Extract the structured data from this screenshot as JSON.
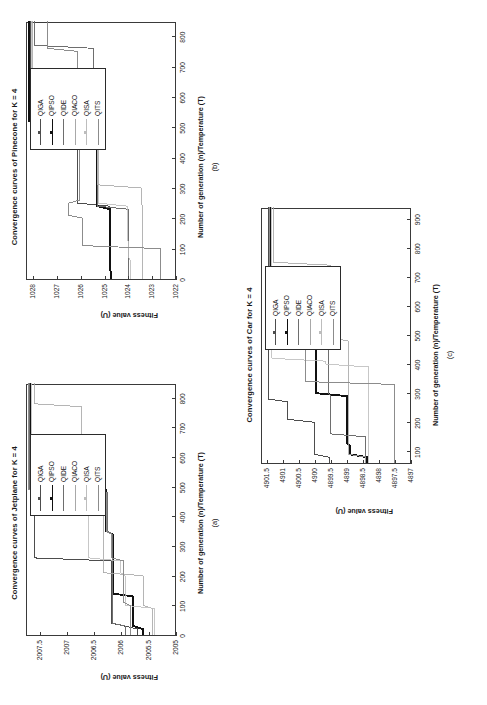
{
  "figure": {
    "orientation_deg": -90,
    "background": "#ffffff",
    "series_names": [
      "QIGA",
      "QIPSO",
      "QIDE",
      "QIACO",
      "QISA",
      "QITS"
    ],
    "series_colors": [
      "#4d4d4d",
      "#111111",
      "#6e6e6e",
      "#a8a8a8",
      "#bdbdbd",
      "#8c8c8c"
    ]
  },
  "panels": {
    "a": {
      "label": "(a)",
      "title": "Convergence curves of Jetplane for K = 4",
      "xlabel": "Number of generation (n)/Temperature (T)",
      "ylabel": "Fitness value (U)"
    },
    "b": {
      "label": "(b)",
      "title": "Convergence curves of Pinecone for K = 4",
      "xlabel": "Number of generation (n)/Temperature (T)",
      "ylabel": "Fitness value (U)"
    },
    "c": {
      "label": "(c)",
      "title": "Convergence curves of Car for K = 4",
      "xlabel": "Number of generation (n)/Temperature (T)",
      "ylabel": "Fitness value (U)"
    }
  },
  "chart_data": [
    {
      "id": "a",
      "type": "line",
      "title": "Convergence curves of Jetplane for K = 4",
      "xlabel": "Number of generation (n)/Temperature (T)",
      "ylabel": "Fitness value (U)",
      "xlim": [
        0,
        850
      ],
      "ylim": [
        2005,
        2007.75
      ],
      "xticks": [
        0,
        100,
        200,
        300,
        400,
        500,
        600,
        700,
        800
      ],
      "yticks": [
        2005,
        2005.5,
        2006,
        2006.5,
        2007,
        2007.5
      ],
      "grid": false,
      "legend_position": "upper right",
      "series": [
        {
          "name": "QIGA",
          "x": [
            0,
            20,
            40,
            250,
            260,
            480,
            490,
            850
          ],
          "y": [
            2005.72,
            2005.72,
            2006.2,
            2006.2,
            2007.62,
            2007.62,
            2007.68,
            2007.68
          ]
        },
        {
          "name": "QIPSO",
          "x": [
            0,
            20,
            30,
            130,
            140,
            340,
            350,
            490,
            500,
            850
          ],
          "y": [
            2005.62,
            2005.62,
            2005.8,
            2005.8,
            2006.18,
            2006.18,
            2006.3,
            2006.3,
            2007.7,
            2007.7
          ]
        },
        {
          "name": "QIDE",
          "x": [
            0,
            30,
            40,
            340,
            350,
            480,
            490,
            850
          ],
          "y": [
            2005.95,
            2005.95,
            2006.18,
            2006.18,
            2006.28,
            2006.28,
            2007.7,
            2007.7
          ]
        },
        {
          "name": "QIACO",
          "x": [
            0,
            90,
            100,
            200,
            210,
            420,
            430,
            560,
            570,
            770,
            780,
            850
          ],
          "y": [
            2005.45,
            2005.45,
            2005.62,
            2005.62,
            2006.35,
            2006.35,
            2006.45,
            2006.45,
            2006.75,
            2006.75,
            2007.62,
            2007.62
          ]
        },
        {
          "name": "QISA",
          "x": [
            0,
            90,
            100,
            200,
            210,
            250,
            260,
            430,
            440,
            470,
            480,
            850
          ],
          "y": [
            2005.42,
            2005.42,
            2005.95,
            2005.95,
            2006.03,
            2006.03,
            2006.62,
            2006.62,
            2006.5,
            2006.5,
            2007.66,
            2007.66
          ]
        },
        {
          "name": "QITS",
          "x": [
            0,
            100,
            110,
            250,
            260,
            340,
            350,
            480,
            490,
            850
          ],
          "y": [
            2005.86,
            2005.86,
            2005.98,
            2005.98,
            2006.2,
            2006.2,
            2006.3,
            2006.3,
            2007.72,
            2007.72
          ]
        }
      ]
    },
    {
      "id": "b",
      "type": "line",
      "title": "Convergence curves of Pinecone for K = 4",
      "xlabel": "Number of generation (n)/Temperature (T)",
      "ylabel": "Fitness value (U)",
      "xlim": [
        0,
        850
      ],
      "ylim": [
        1022,
        1028.3
      ],
      "xticks": [
        0,
        100,
        200,
        300,
        400,
        500,
        600,
        700,
        800
      ],
      "yticks": [
        1022,
        1023,
        1024,
        1025,
        1026,
        1027,
        1028
      ],
      "grid": false,
      "legend_position": "upper right",
      "series": [
        {
          "name": "QIGA",
          "x": [
            0,
            20,
            30,
            240,
            250,
            450,
            460,
            850
          ],
          "y": [
            1024.8,
            1024.8,
            1024.82,
            1024.82,
            1026.2,
            1026.2,
            1028.15,
            1028.15
          ]
        },
        {
          "name": "QIPSO",
          "x": [
            0,
            20,
            30,
            230,
            240,
            510,
            520,
            850
          ],
          "y": [
            1024.78,
            1024.78,
            1024.8,
            1024.8,
            1025.35,
            1025.35,
            1028.2,
            1028.2
          ]
        },
        {
          "name": "QIDE",
          "x": [
            0,
            80,
            90,
            230,
            240,
            510,
            520,
            760,
            770,
            850
          ],
          "y": [
            1024.02,
            1024.02,
            1024.05,
            1024.05,
            1025.35,
            1025.35,
            1025.5,
            1025.5,
            1028.0,
            1028.0
          ]
        },
        {
          "name": "QIACO",
          "x": [
            0,
            240,
            250,
            300,
            310,
            600,
            610,
            850
          ],
          "y": [
            1023.45,
            1023.45,
            1023.5,
            1023.5,
            1025.3,
            1025.3,
            1028.05,
            1028.05
          ]
        },
        {
          "name": "QISA",
          "x": [
            0,
            60,
            70,
            120,
            130,
            240,
            250,
            300,
            310,
            600,
            610,
            850
          ],
          "y": [
            1023.95,
            1023.95,
            1024.02,
            1024.02,
            1024.1,
            1024.1,
            1025.3,
            1025.3,
            1025.32,
            1025.32,
            1028.1,
            1028.1
          ]
        },
        {
          "name": "QITS",
          "x": [
            0,
            100,
            110,
            200,
            210,
            250,
            260,
            450,
            460,
            750,
            760,
            850
          ],
          "y": [
            1022.7,
            1022.7,
            1025.95,
            1025.95,
            1026.55,
            1026.55,
            1026.1,
            1026.1,
            1026.2,
            1026.2,
            1027.45,
            1027.45
          ]
        }
      ]
    },
    {
      "id": "c",
      "type": "line",
      "title": "Convergence curves of Car for K = 4",
      "xlabel": "Number of generation (n)/Temperature (T)",
      "ylabel": "Fitness value (U)",
      "xlim": [
        60,
        940
      ],
      "ylim": [
        4897,
        4901.7
      ],
      "xticks": [
        100,
        200,
        300,
        400,
        500,
        600,
        700,
        800,
        900
      ],
      "yticks": [
        4897,
        4897.5,
        4898,
        4898.5,
        4899,
        4899.5,
        4900,
        4900.5,
        4901,
        4901.5
      ],
      "grid": false,
      "legend_position": "upper right",
      "series": [
        {
          "name": "QIGA",
          "x": [
            60,
            80,
            90,
            200,
            210,
            270,
            280,
            940
          ],
          "y": [
            4899.6,
            4899.6,
            4900.05,
            4900.05,
            4900.9,
            4900.9,
            4901.5,
            4901.5
          ]
        },
        {
          "name": "QIPSO",
          "x": [
            60,
            80,
            90,
            120,
            130,
            290,
            300,
            590,
            600,
            940
          ],
          "y": [
            4898.4,
            4898.4,
            4898.95,
            4898.95,
            4899.05,
            4899.05,
            4900.0,
            4900.0,
            4901.45,
            4901.45
          ]
        },
        {
          "name": "QIDE",
          "x": [
            60,
            150,
            160,
            290,
            300,
            530,
            540,
            940
          ],
          "y": [
            4898.45,
            4898.45,
            4899.55,
            4899.55,
            4899.62,
            4899.62,
            4901.45,
            4901.45
          ]
        },
        {
          "name": "QIACO",
          "x": [
            60,
            80,
            90,
            480,
            490,
            740,
            750,
            940
          ],
          "y": [
            4898.45,
            4898.45,
            4899.0,
            4899.0,
            4899.55,
            4899.55,
            4901.35,
            4901.35
          ]
        },
        {
          "name": "QISA",
          "x": [
            60,
            390,
            400,
            410,
            420,
            940
          ],
          "y": [
            4898.35,
            4898.35,
            4899.7,
            4899.7,
            4901.4,
            4901.4
          ]
        },
        {
          "name": "QITS",
          "x": [
            60,
            330,
            340,
            710,
            720,
            940
          ],
          "y": [
            4897.55,
            4897.55,
            4900.35,
            4900.35,
            4901.45,
            4901.45
          ]
        }
      ]
    }
  ]
}
